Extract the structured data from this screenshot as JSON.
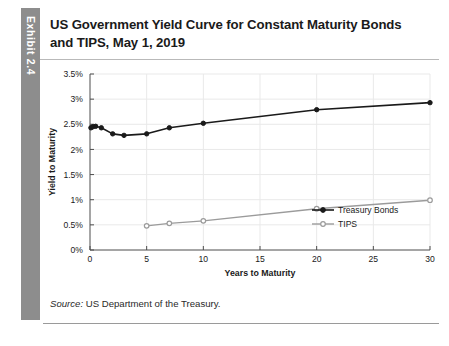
{
  "exhibit": {
    "tab_label": "Exhibit 2.4"
  },
  "title": "US Government Yield Curve for Constant Maturity Bonds and TIPS, May 1, 2019",
  "source": {
    "label": "Source:",
    "text": "US Department of the Treasury."
  },
  "chart_data": {
    "type": "line",
    "title": "US Government Yield Curve for Constant Maturity Bonds and TIPS, May 1, 2019",
    "xlabel": "Years to Maturity",
    "ylabel": "Yield to Maturity",
    "xlim": [
      0,
      30
    ],
    "ylim": [
      0,
      3.5
    ],
    "xticks": [
      0,
      5,
      10,
      15,
      20,
      25,
      30
    ],
    "xtick_labels": [
      "0",
      "5",
      "10",
      "15",
      "20",
      "25",
      "30"
    ],
    "yticks": [
      0,
      0.5,
      1,
      1.5,
      2,
      2.5,
      3,
      3.5
    ],
    "ytick_labels": [
      "0%",
      "0.5%",
      "1%",
      "1.5%",
      "2%",
      "2.5%",
      "3%",
      "3.5%"
    ],
    "grid": true,
    "legend_position": "lower right",
    "series": [
      {
        "name": "Treasury Bonds",
        "color": "#1a1a1a",
        "marker": "circle-filled",
        "x": [
          0.083,
          0.25,
          0.5,
          1,
          2,
          3,
          5,
          7,
          10,
          20,
          30
        ],
        "y": [
          2.43,
          2.45,
          2.46,
          2.43,
          2.31,
          2.28,
          2.31,
          2.43,
          2.52,
          2.79,
          2.93
        ]
      },
      {
        "name": "TIPS",
        "color": "#9b9b9b",
        "marker": "circle-open",
        "x": [
          5,
          7,
          10,
          20,
          30
        ],
        "y": [
          0.48,
          0.53,
          0.58,
          0.82,
          0.99
        ]
      }
    ]
  }
}
